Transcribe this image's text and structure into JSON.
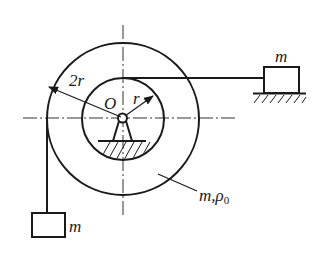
{
  "diagram": {
    "type": "mechanics-pulley-system",
    "colors": {
      "stroke": "#1a1a1a",
      "centerline": "#333333",
      "background": "#ffffff"
    },
    "wheel": {
      "center_label": "O",
      "outer_radius_label": "2r",
      "inner_radius_label": "r",
      "mass_label": "m,ρ",
      "mass_label_sub": "0"
    },
    "blocks": [
      {
        "id": "hanging-block",
        "label": "m",
        "position": "bottom-left, hanging from outer rim"
      },
      {
        "id": "sliding-block",
        "label": "m",
        "position": "right, on horizontal ground, tied to inner hub"
      }
    ],
    "supports": [
      {
        "id": "pivot-ground",
        "type": "hatched fixed support under pivot"
      },
      {
        "id": "block-ground",
        "type": "hatched floor under right block"
      }
    ]
  }
}
